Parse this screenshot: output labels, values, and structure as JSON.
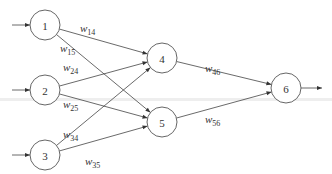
{
  "diagram": {
    "type": "feedforward-neural-network",
    "nodes": [
      {
        "id": "1",
        "label": "1",
        "layer": "input"
      },
      {
        "id": "2",
        "label": "2",
        "layer": "input"
      },
      {
        "id": "3",
        "label": "3",
        "layer": "input"
      },
      {
        "id": "4",
        "label": "4",
        "layer": "hidden"
      },
      {
        "id": "5",
        "label": "5",
        "layer": "hidden"
      },
      {
        "id": "6",
        "label": "6",
        "layer": "output"
      }
    ],
    "edges": [
      {
        "from": "1",
        "to": "4",
        "weight_symbol": "w",
        "weight_sub": "14"
      },
      {
        "from": "1",
        "to": "5",
        "weight_symbol": "w",
        "weight_sub": "15"
      },
      {
        "from": "2",
        "to": "4",
        "weight_symbol": "w",
        "weight_sub": "24"
      },
      {
        "from": "2",
        "to": "5",
        "weight_symbol": "w",
        "weight_sub": "25"
      },
      {
        "from": "3",
        "to": "4",
        "weight_symbol": "w",
        "weight_sub": "34"
      },
      {
        "from": "3",
        "to": "5",
        "weight_symbol": "w",
        "weight_sub": "35"
      },
      {
        "from": "4",
        "to": "6",
        "weight_symbol": "w",
        "weight_sub": "46"
      },
      {
        "from": "5",
        "to": "6",
        "weight_symbol": "w",
        "weight_sub": "56"
      }
    ],
    "inputs": [
      "1",
      "2",
      "3"
    ],
    "outputs": [
      "6"
    ]
  }
}
